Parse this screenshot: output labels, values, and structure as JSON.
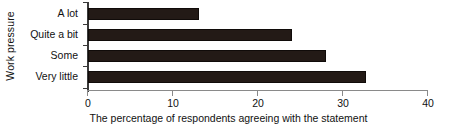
{
  "chart_data": {
    "type": "bar",
    "orientation": "horizontal",
    "title": "",
    "xlabel": "The percentage of respondents agreeing with the statement",
    "ylabel": "Work pressure",
    "categories": [
      "A lot",
      "Quite a bit",
      "Some",
      "Very little"
    ],
    "values": [
      13,
      24,
      28,
      32.7
    ],
    "xlim": [
      0,
      40
    ],
    "xticks": [
      0,
      10,
      20,
      30,
      40
    ],
    "xtick_labels": [
      "0",
      "10",
      "20",
      "30",
      "40"
    ],
    "grid": false,
    "legend": false,
    "series": [
      {
        "name": "The percentage of respondents agreeing with the statement",
        "values": [
          13,
          24,
          28,
          32.7
        ]
      }
    ],
    "colors": {
      "bar_fill": "#231a16",
      "bar_edge": "#100b09",
      "value_axis_line": "#8a8a8a",
      "category_axis_line": "#3a3a3a",
      "background": "#ffffff",
      "text": "#111111"
    }
  }
}
